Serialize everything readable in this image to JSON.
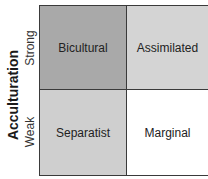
{
  "axis": {
    "title": "Acculturation",
    "rows": [
      "Strong",
      "Weak"
    ]
  },
  "cells": [
    {
      "label": "Bicultural",
      "color": "#a9a9a9"
    },
    {
      "label": "Assimilated",
      "color": "#d4d4d4"
    },
    {
      "label": "Separatist",
      "color": "#cfcfcf"
    },
    {
      "label": "Marginal",
      "color": "#ffffff"
    }
  ]
}
